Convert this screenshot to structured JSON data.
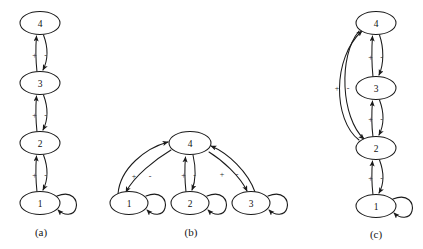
{
  "figure": {
    "background_color": "#ffffff",
    "line_color": "#1a1a1a",
    "node_fill": "#ffffff",
    "panel_count": 3
  },
  "panels": [
    {
      "id": "a",
      "caption": "(a)",
      "layout": "vertical-chain",
      "nodes": [
        {
          "label": "4",
          "cx": 40,
          "cy": 23
        },
        {
          "label": "3",
          "cx": 40,
          "cy": 83
        },
        {
          "label": "2",
          "cx": 40,
          "cy": 143
        },
        {
          "label": "1",
          "cx": 40,
          "cy": 203
        }
      ],
      "edges": [
        {
          "from": "3",
          "to": "4",
          "sign": "+"
        },
        {
          "from": "4",
          "to": "3",
          "sign": "-"
        },
        {
          "from": "2",
          "to": "3",
          "sign": "+"
        },
        {
          "from": "3",
          "to": "2",
          "sign": "-"
        },
        {
          "from": "1",
          "to": "2",
          "sign": "+"
        },
        {
          "from": "2",
          "to": "1",
          "sign": "-"
        }
      ],
      "self_loops": [
        {
          "node": "1",
          "side": "right"
        }
      ]
    },
    {
      "id": "b",
      "caption": "(b)",
      "layout": "star-hub",
      "nodes": [
        {
          "label": "4",
          "cx": 190,
          "cy": 143
        },
        {
          "label": "1",
          "cx": 129,
          "cy": 203
        },
        {
          "label": "2",
          "cx": 190,
          "cy": 203
        },
        {
          "label": "3",
          "cx": 251,
          "cy": 203
        }
      ],
      "edges": [
        {
          "from": "1",
          "to": "4",
          "sign": "+"
        },
        {
          "from": "4",
          "to": "1",
          "sign": "-"
        },
        {
          "from": "2",
          "to": "4",
          "sign": "+"
        },
        {
          "from": "4",
          "to": "2",
          "sign": "-"
        },
        {
          "from": "3",
          "to": "4",
          "sign": "+"
        },
        {
          "from": "4",
          "to": "3",
          "sign": "-"
        }
      ],
      "self_loops": [
        {
          "node": "1",
          "side": "right"
        },
        {
          "node": "2",
          "side": "right"
        },
        {
          "node": "3",
          "side": "right"
        }
      ]
    },
    {
      "id": "c",
      "caption": "(c)",
      "layout": "vertical-chain-with-bypass",
      "nodes": [
        {
          "label": "4",
          "cx": 376,
          "cy": 23
        },
        {
          "label": "3",
          "cx": 376,
          "cy": 88
        },
        {
          "label": "2",
          "cx": 376,
          "cy": 148
        },
        {
          "label": "1",
          "cx": 376,
          "cy": 206
        }
      ],
      "edges": [
        {
          "from": "3",
          "to": "4",
          "sign": "+"
        },
        {
          "from": "4",
          "to": "3",
          "sign": "-"
        },
        {
          "from": "2",
          "to": "3",
          "sign": "+"
        },
        {
          "from": "3",
          "to": "2",
          "sign": "-"
        },
        {
          "from": "1",
          "to": "2",
          "sign": "+"
        },
        {
          "from": "2",
          "to": "1",
          "sign": "-"
        },
        {
          "from": "2",
          "to": "4",
          "sign": "+",
          "route": "bypass-left"
        },
        {
          "from": "4",
          "to": "2",
          "sign": "-",
          "route": "bypass-left"
        }
      ],
      "self_loops": [
        {
          "node": "1",
          "side": "right"
        }
      ]
    }
  ],
  "signs": {
    "positive": "+",
    "negative": "-"
  }
}
